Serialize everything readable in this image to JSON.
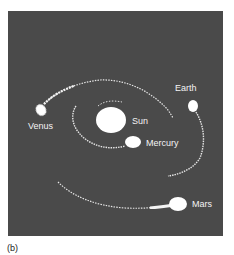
{
  "figure": {
    "panel_label": "(b)",
    "background_color": "#4a4a4a",
    "foreground_color": "#ffffff",
    "bodies": [
      {
        "name": "Sun",
        "label": "Sun"
      },
      {
        "name": "Mercury",
        "label": "Mercury"
      },
      {
        "name": "Venus",
        "label": "Venus"
      },
      {
        "name": "Earth",
        "label": "Earth"
      },
      {
        "name": "Mars",
        "label": "Mars"
      }
    ]
  }
}
